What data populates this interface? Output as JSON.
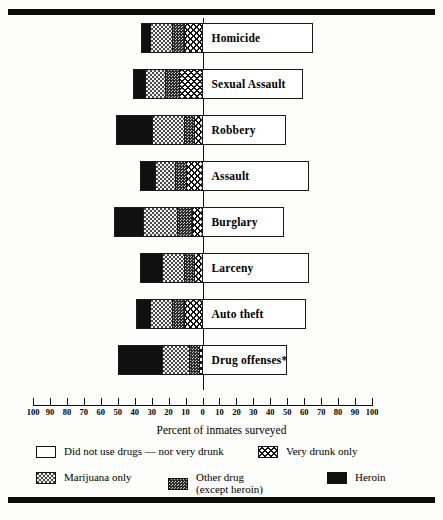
{
  "chart_data": {
    "type": "bar",
    "title": "",
    "xlabel": "Percent of inmates surveyed",
    "ylabel": "",
    "orientation": "horizontal",
    "stacked": true,
    "diverging": true,
    "xlim": [
      -100,
      100
    ],
    "axis_ticks": [
      "100",
      "90",
      "80",
      "70",
      "60",
      "50",
      "40",
      "30",
      "20",
      "10",
      "0",
      "10",
      "20",
      "30",
      "40",
      "50",
      "60",
      "70",
      "80",
      "90",
      "100"
    ],
    "axis_tick_values": [
      -100,
      -90,
      -80,
      -70,
      -60,
      -50,
      -40,
      -30,
      -20,
      -10,
      0,
      10,
      20,
      30,
      40,
      50,
      60,
      70,
      80,
      90,
      100
    ],
    "grid": false,
    "legend_position": "bottom",
    "footnote_marker": "*",
    "categories": [
      "Homicide",
      "Sexual Assault",
      "Robbery",
      "Assault",
      "Burglary",
      "Larceny",
      "Auto theft",
      "Drug offenses*"
    ],
    "series": [
      {
        "name": "Heroin",
        "key": "heroin",
        "fill": "solid-black",
        "values": [
          5,
          7,
          21,
          9,
          17,
          13,
          8,
          26
        ]
      },
      {
        "name": "Marijuana only",
        "key": "marijuana",
        "fill": "light-dots",
        "values": [
          13,
          12,
          19,
          12,
          20,
          13,
          13,
          16
        ]
      },
      {
        "name": "Other drug (except heroin)",
        "key": "other_drug",
        "fill": "medium-dots",
        "values": [
          7,
          8,
          6,
          6,
          9,
          6,
          7,
          6
        ]
      },
      {
        "name": "Very drunk only",
        "key": "very_drunk",
        "fill": "crosshatch",
        "values": [
          11,
          14,
          5,
          10,
          6,
          5,
          11,
          2
        ]
      },
      {
        "name": "Did not use drugs — nor very drunk",
        "key": "no_drugs",
        "fill": "white",
        "values": [
          65,
          59,
          49,
          63,
          48,
          63,
          61,
          50
        ]
      }
    ]
  },
  "axis": {
    "title": "Percent of inmates surveyed"
  },
  "legend": {
    "items": [
      {
        "label": "Did not use drugs — nor very drunk",
        "sublabel": "",
        "fill": "white"
      },
      {
        "label": "Very drunk only",
        "sublabel": "",
        "fill": "crosshatch"
      },
      {
        "label": "Marijuana only",
        "sublabel": "",
        "fill": "light-dots"
      },
      {
        "label": "Other drug",
        "sublabel": "(except heroin)",
        "fill": "medium-dots"
      },
      {
        "label": "Heroin",
        "sublabel": "",
        "fill": "solid-black"
      }
    ]
  },
  "colors": {
    "ink": "#101010",
    "page": "#fdfdfb",
    "rule": "#0b0b0b"
  }
}
